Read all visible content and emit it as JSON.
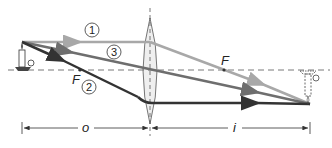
{
  "diagram": {
    "type": "thin converging lens ray diagram",
    "labels": {
      "focal_left": "F",
      "focal_right": "F",
      "object_distance": "o",
      "image_distance": "i"
    },
    "rays": [
      {
        "id": "1",
        "label": "1",
        "description": "parallel to axis, refracts through far focal point",
        "color": "#a8a8a8"
      },
      {
        "id": "2",
        "label": "2",
        "description": "through near focal point, exits parallel to axis",
        "color": "#3a3a3a"
      },
      {
        "id": "3",
        "label": "3",
        "description": "through lens center, undeviated",
        "color": "#6e6e6e"
      }
    ],
    "object": "candle (upright, left of lens)",
    "image": "candle (inverted, real, right of lens, dashed outline)",
    "colors": {
      "axis": "#555555",
      "lens_fill": "#efefef",
      "lens_stroke": "#555555"
    }
  }
}
